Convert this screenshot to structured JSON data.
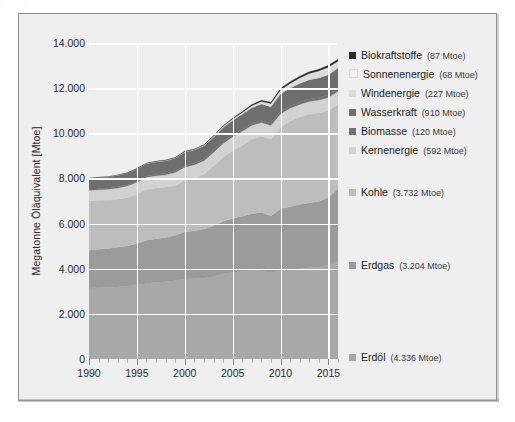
{
  "figure": {
    "background_color": "#efefef",
    "border_color": "#8c8c8c",
    "top_page_text": "· , , , · ,"
  },
  "axis": {
    "y_label": "Megatonne Öläquivalent [Mtoe]",
    "y_ticks": [
      "0",
      "2.000",
      "4.000",
      "6.000",
      "8.000",
      "10.000",
      "12.000",
      "14.000"
    ],
    "x_ticks": [
      "1990",
      "1995",
      "2000",
      "2005",
      "2010",
      "2015"
    ]
  },
  "legend": {
    "items": [
      {
        "name": "Biokraftstoffe",
        "value": "(87 Mtoe)",
        "color": "#2c2c2c"
      },
      {
        "name": "Sonnenenergie",
        "value": "(68 Mtoe)",
        "color": "#efefef"
      },
      {
        "name": "Windenergie",
        "value": "(227 Mtoe)",
        "color": "#dcdcdc"
      },
      {
        "name": "Wasserkraft",
        "value": "(910 Mtoe)",
        "color": "#6e6e6e"
      },
      {
        "name": "Biomasse",
        "value": "(120 Mtoe)",
        "color": "#717171"
      },
      {
        "name": "Kernenergie",
        "value": "(592 Mtoe)",
        "color": "#d2d2d2"
      },
      {
        "name": "Kohle",
        "value": "(3.732 Mtoe)",
        "color": "#bdbdbd"
      },
      {
        "name": "Erdgas",
        "value": "(3.204 Mtoe)",
        "color": "#9b9b9b"
      },
      {
        "name": "Erdöl",
        "value": "(4.336 Mtoe)",
        "color": "#a8a8a8"
      }
    ]
  },
  "chart_data": {
    "type": "area",
    "title": "",
    "xlabel": "",
    "ylabel": "Megatonne Öläquivalent [Mtoe]",
    "xlim": [
      1990,
      2016
    ],
    "ylim": [
      0,
      14000
    ],
    "ytick_values": [
      0,
      2000,
      4000,
      6000,
      8000,
      10000,
      12000,
      14000
    ],
    "xtick_values": [
      1990,
      1995,
      2000,
      2005,
      2010,
      2015
    ],
    "grid": true,
    "grid_color": "#ffffff",
    "legend_position": "right",
    "stack_order_bottom_to_top": [
      "Erdöl",
      "Erdgas",
      "Kohle",
      "Kernenergie",
      "Biomasse",
      "Wasserkraft",
      "Windenergie",
      "Sonnenenergie",
      "Biokraftstoffe"
    ],
    "x": [
      1990,
      1991,
      1992,
      1993,
      1994,
      1995,
      1996,
      1997,
      1998,
      1999,
      2000,
      2001,
      2002,
      2003,
      2004,
      2005,
      2006,
      2007,
      2008,
      2009,
      2010,
      2011,
      2012,
      2013,
      2014,
      2015,
      2016
    ],
    "series": [
      {
        "name": "Erdöl",
        "color": "#a8a8a8",
        "total_label": "4.336 Mtoe",
        "values": [
          3150,
          3160,
          3180,
          3190,
          3230,
          3280,
          3340,
          3400,
          3420,
          3470,
          3540,
          3560,
          3580,
          3650,
          3780,
          3840,
          3880,
          3920,
          3910,
          3820,
          3940,
          3970,
          4000,
          4040,
          4080,
          4180,
          4336
        ]
      },
      {
        "name": "Erdgas",
        "color": "#9b9b9b",
        "total_label": "3.204 Mtoe",
        "values": [
          1670,
          1700,
          1720,
          1760,
          1780,
          1840,
          1920,
          1930,
          1960,
          2010,
          2090,
          2120,
          2180,
          2250,
          2320,
          2390,
          2440,
          2520,
          2580,
          2520,
          2720,
          2770,
          2840,
          2880,
          2900,
          2990,
          3204
        ]
      },
      {
        "name": "Kohle",
        "color": "#bdbdbd",
        "total_label": "3.732 Mtoe",
        "values": [
          2200,
          2170,
          2140,
          2130,
          2140,
          2190,
          2250,
          2250,
          2230,
          2210,
          2290,
          2340,
          2420,
          2650,
          2840,
          3000,
          3150,
          3300,
          3380,
          3400,
          3600,
          3800,
          3880,
          3930,
          3920,
          3840,
          3732
        ]
      },
      {
        "name": "Kernenergie",
        "color": "#d2d2d2",
        "total_label": "592 Mtoe",
        "values": [
          450,
          470,
          480,
          500,
          510,
          520,
          540,
          540,
          550,
          570,
          580,
          590,
          600,
          600,
          610,
          620,
          620,
          610,
          610,
          600,
          610,
          570,
          550,
          560,
          570,
          580,
          592
        ]
      },
      {
        "name": "Biomasse",
        "color": "#717171",
        "total_label": "120 Mtoe",
        "values": [
          40,
          42,
          44,
          46,
          48,
          50,
          53,
          55,
          57,
          60,
          63,
          66,
          69,
          72,
          76,
          80,
          84,
          88,
          92,
          96,
          100,
          104,
          107,
          110,
          113,
          117,
          120
        ]
      },
      {
        "name": "Wasserkraft",
        "color": "#6e6e6e",
        "total_label": "910 Mtoe",
        "values": [
          490,
          500,
          505,
          520,
          530,
          545,
          560,
          565,
          570,
          580,
          600,
          590,
          595,
          605,
          630,
          650,
          670,
          690,
          720,
          740,
          780,
          790,
          830,
          850,
          870,
          890,
          910
        ]
      },
      {
        "name": "Windenergie",
        "color": "#dcdcdc",
        "total_label": "227 Mtoe",
        "values": [
          1,
          2,
          2,
          3,
          4,
          6,
          8,
          10,
          13,
          17,
          22,
          26,
          32,
          40,
          50,
          60,
          74,
          90,
          110,
          132,
          158,
          186,
          214,
          240,
          262,
          280,
          227
        ]
      },
      {
        "name": "Sonnenenergie",
        "color": "#efefef",
        "total_label": "68 Mtoe",
        "values": [
          0,
          0,
          0,
          0,
          0,
          0,
          0,
          0,
          1,
          1,
          1,
          1,
          2,
          2,
          3,
          3,
          4,
          5,
          7,
          9,
          13,
          20,
          28,
          36,
          44,
          54,
          68
        ]
      },
      {
        "name": "Biokraftstoffe",
        "color": "#2c2c2c",
        "total_label": "87 Mtoe",
        "values": [
          2,
          3,
          3,
          4,
          5,
          6,
          7,
          8,
          10,
          11,
          13,
          15,
          18,
          22,
          27,
          33,
          41,
          50,
          58,
          63,
          70,
          74,
          77,
          80,
          82,
          85,
          87
        ]
      }
    ]
  }
}
